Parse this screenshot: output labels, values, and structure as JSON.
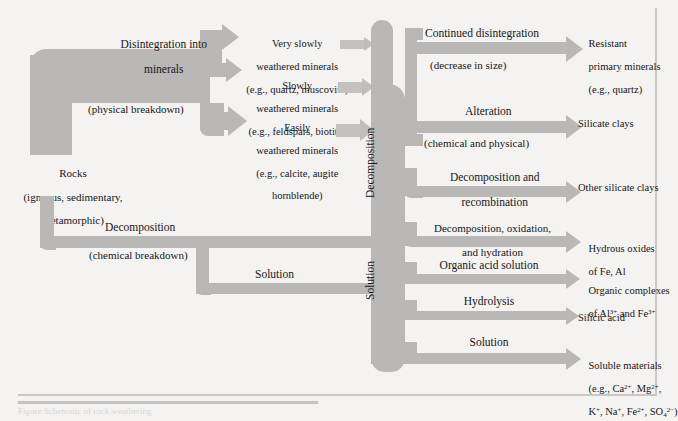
{
  "figure": {
    "kind": "flow-diagram",
    "title_caption": "Figure   Schematic  of  rock  weathering",
    "bleed_text": "",
    "colors": {
      "background": "#f4f3f1",
      "arrow_gray": "#b9b8b6",
      "arrow_gray_light": "#c3c2c0",
      "arrow_gray_dark": "#aeadab",
      "text": "#16161a",
      "frame": "#c9c8c6"
    }
  },
  "source": {
    "label_line1": "Rocks",
    "label_line2": "(igneous, sedimentary,",
    "label_line3": "metamorphic)"
  },
  "pathways": {
    "physical": {
      "name": "Disintegration into",
      "name_line2": "minerals",
      "note": "(physical breakdown)"
    },
    "chemical": {
      "name": "Decomposition",
      "note": "(chemical breakdown)"
    },
    "solution": {
      "name": "Solution"
    }
  },
  "spine_labels": {
    "decomposition": "Decomposition",
    "solution": "Solution"
  },
  "minerals": [
    {
      "id": "very-slowly",
      "line1": "Very slowly",
      "line2": "weathered minerals",
      "line3": "(e.g., quartz, muscovite)"
    },
    {
      "id": "slowly",
      "line1": "Slowly",
      "line2": "weathered minerals",
      "line3": "(e.g., feldspars, biotite)"
    },
    {
      "id": "easily",
      "line1": "Easily",
      "line2": "weathered minerals",
      "line3": "(e.g., calcite, augite",
      "line4": "hornblende)"
    }
  ],
  "processes": [
    {
      "id": "continued-disintegration",
      "label": "Continued disintegration",
      "note": "(decrease in size)"
    },
    {
      "id": "alteration",
      "label": "Alteration",
      "note": "(chemical and physical)"
    },
    {
      "id": "decomposition-recombination",
      "label": "Decomposition and",
      "label2": "recombination",
      "note": ""
    },
    {
      "id": "decomposition-oxidation-hydration",
      "label": "Decomposition, oxidation,",
      "label2": "and hydration",
      "note": ""
    },
    {
      "id": "organic-acid-solution",
      "label": "Organic acid solution",
      "note": ""
    },
    {
      "id": "hydrolysis",
      "label": "Hydrolysis",
      "note": ""
    },
    {
      "id": "solution",
      "label": "Solution",
      "note": ""
    }
  ],
  "products": [
    {
      "id": "resistant-primary-minerals",
      "line1": "Resistant",
      "line2": "primary minerals",
      "line3": "(e.g., quartz)"
    },
    {
      "id": "silicate-clays",
      "line1": "Silicate clays",
      "line2": "",
      "line3": ""
    },
    {
      "id": "other-silicate-clays",
      "line1": "Other silicate clays",
      "line2": "",
      "line3": ""
    },
    {
      "id": "hydrous-oxides",
      "line1": "Hydrous oxides",
      "line2": "of Fe, Al",
      "line3": ""
    },
    {
      "id": "organic-complexes",
      "line1": "Organic complexes",
      "line2": "of Al3+ and Fe3+",
      "line3": ""
    },
    {
      "id": "silicic-acid",
      "line1": "Silicic acid",
      "line2": "",
      "line3": ""
    },
    {
      "id": "soluble-materials",
      "line1": "Soluble materials",
      "line2": "(e.g., Ca2+, Mg2+,",
      "line3": "K+, Na+, Fe2+, SO42-)"
    }
  ]
}
